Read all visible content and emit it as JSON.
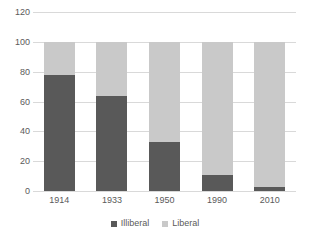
{
  "chart_data": {
    "type": "bar",
    "subtype": "stacked-100-percent",
    "title": "",
    "subtitle": "",
    "xlabel": "",
    "ylabel": "",
    "categories": [
      "1914",
      "1933",
      "1950",
      "1990",
      "2010"
    ],
    "series": [
      {
        "name": "Illiberal",
        "color": "#595959",
        "values": [
          78,
          64,
          33,
          11,
          3
        ]
      },
      {
        "name": "Liberal",
        "color": "#c9c9c9",
        "values": [
          22,
          36,
          67,
          89,
          97
        ]
      }
    ],
    "ylim": [
      0,
      120
    ],
    "ytick_labels": [
      "0",
      "20",
      "40",
      "60",
      "80",
      "100",
      "120"
    ],
    "ytick_values": [
      0,
      20,
      40,
      60,
      80,
      100,
      120
    ],
    "grid": true,
    "grid_color": "#d9d9d9",
    "legend_position": "bottom",
    "background": "#ffffff",
    "axis_text_color": "#5a5a5a"
  },
  "legend": {
    "items": [
      {
        "label": "Illiberal"
      },
      {
        "label": "Liberal"
      }
    ]
  },
  "y_axis": {
    "ticks": [
      {
        "label": "120"
      },
      {
        "label": "100"
      },
      {
        "label": "80"
      },
      {
        "label": "60"
      },
      {
        "label": "40"
      },
      {
        "label": "20"
      },
      {
        "label": "0"
      }
    ]
  },
  "x_axis": {
    "ticks": [
      {
        "label": "1914"
      },
      {
        "label": "1933"
      },
      {
        "label": "1950"
      },
      {
        "label": "1990"
      },
      {
        "label": "2010"
      }
    ]
  }
}
